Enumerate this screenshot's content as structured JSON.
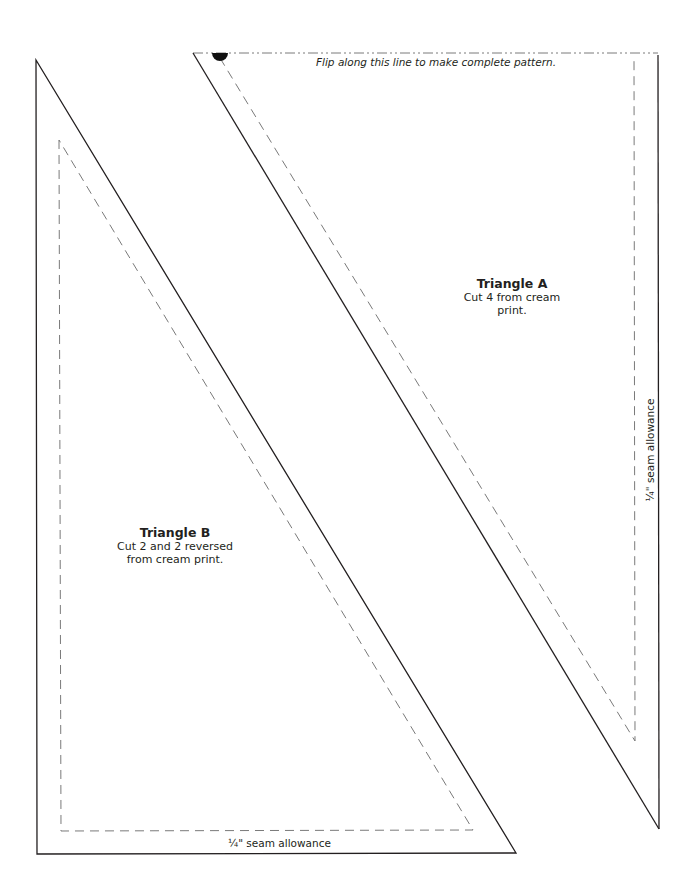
{
  "colors": {
    "outline": "#231f20",
    "dashed": "#7a7a7a",
    "background": "#ffffff"
  },
  "fold_line": {
    "text": "Flip along this line to make complete pattern."
  },
  "triangle_a": {
    "title": "Triangle A",
    "instruction": "Cut 4 from cream print.",
    "seam_label": "¼\" seam allowance"
  },
  "triangle_b": {
    "title": "Triangle B",
    "instruction_line1": "Cut 2 and 2 reversed",
    "instruction_line2": "from cream print.",
    "seam_label": "¼\" seam allowance"
  }
}
